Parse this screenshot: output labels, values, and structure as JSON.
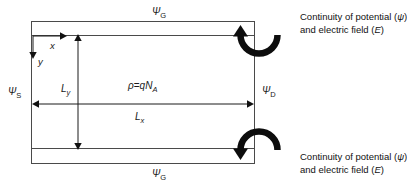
{
  "diagram": {
    "box": {
      "top_label": "Ψ",
      "top_label_sub": "G",
      "bottom_label": "Ψ",
      "bottom_label_sub": "G",
      "left_label": "Ψ",
      "left_label_sub": "S",
      "right_label": "Ψ",
      "right_label_sub": "D"
    },
    "axes": {
      "x_label": "x",
      "y_label": "y"
    },
    "dimensions": {
      "vertical_label": "L",
      "vertical_sub": "y",
      "horizontal_label": "L",
      "horizontal_sub": "x"
    },
    "equation": {
      "lhs": "ρ",
      "operator": "=",
      "rhs_charge": "q",
      "rhs_symbol": "N",
      "rhs_sub": "A"
    },
    "annotations": [
      {
        "line1_pre": "Continuity of potential (",
        "line1_symbol": "ψ",
        "line1_post": ")",
        "line2_pre": "and electric field (",
        "line2_symbol": "E",
        "line2_post": ")"
      },
      {
        "line1_pre": "Continuity of potential (",
        "line1_symbol": "ψ",
        "line1_post": ")",
        "line2_pre": "and electric field (",
        "line2_symbol": "E",
        "line2_post": ")"
      }
    ],
    "colors": {
      "stroke": "#3c3c3c",
      "arrow": "#000000",
      "text": "#1a1a1a",
      "background": "#ffffff"
    }
  }
}
